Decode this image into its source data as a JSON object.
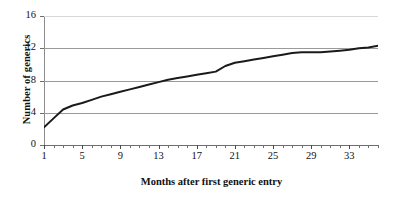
{
  "chart_data": {
    "type": "line",
    "title": "",
    "xlabel": "Months after first generic entry",
    "ylabel": "Number of generics",
    "xlim": [
      1,
      36
    ],
    "ylim": [
      0,
      16
    ],
    "ytick_labels": [
      "0",
      "4",
      "8",
      "12",
      "16"
    ],
    "yticks": [
      0,
      4,
      8,
      12,
      16
    ],
    "xtick_labels": [
      "1",
      "5",
      "9",
      "13",
      "17",
      "21",
      "25",
      "29",
      "33"
    ],
    "xticks": [
      1,
      5,
      9,
      13,
      17,
      21,
      25,
      29,
      33
    ],
    "grid": "horizontal",
    "legend": "none",
    "line_color": "#1a1a1a",
    "grid_color": "#9a9a9a",
    "x": [
      1,
      2,
      3,
      4,
      5,
      6,
      7,
      8,
      9,
      10,
      11,
      12,
      13,
      14,
      15,
      16,
      17,
      18,
      19,
      20,
      21,
      22,
      23,
      24,
      25,
      26,
      27,
      28,
      29,
      30,
      31,
      32,
      33,
      34,
      35,
      36
    ],
    "values": [
      2.2,
      3.3,
      4.4,
      4.9,
      5.2,
      5.6,
      6.0,
      6.3,
      6.6,
      6.9,
      7.2,
      7.5,
      7.8,
      8.1,
      8.3,
      8.5,
      8.7,
      8.9,
      9.1,
      9.8,
      10.2,
      10.4,
      10.6,
      10.8,
      11.0,
      11.2,
      11.4,
      11.5,
      11.5,
      11.5,
      11.6,
      11.7,
      11.8,
      12.0,
      12.1,
      12.3
    ],
    "series_name": "Number of generics"
  }
}
